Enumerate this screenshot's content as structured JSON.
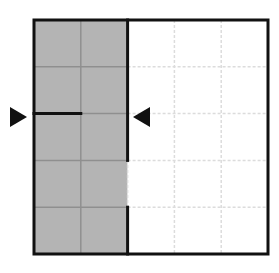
{
  "diagram": {
    "type": "grid-puzzle",
    "rows": 5,
    "cols": 5,
    "origin": {
      "x": 34,
      "y": 20
    },
    "cell_size": 46.8,
    "colors": {
      "shaded": "#b4b4b4",
      "shaded_grid": "#8f8f8f",
      "empty": "#ffffff",
      "empty_grid": "#dcdcdc",
      "border": "#111111",
      "arrow": "#111111"
    },
    "shaded_columns": [
      0,
      1
    ],
    "thick_segments": [
      {
        "name": "divider-upper",
        "x1": 2,
        "y1": 0,
        "x2": 2,
        "y2": 3
      },
      {
        "name": "divider-lower",
        "x1": 2,
        "y1": 4,
        "x2": 2,
        "y2": 5
      },
      {
        "name": "cut-line",
        "x1": 0,
        "y1": 2,
        "x2": 1,
        "y2": 2
      }
    ],
    "arrows": [
      {
        "name": "left-marker-arrow",
        "direction": "right",
        "x": 16,
        "y": 117
      },
      {
        "name": "right-marker-arrow",
        "direction": "left",
        "x": 144,
        "y": 117
      }
    ]
  }
}
